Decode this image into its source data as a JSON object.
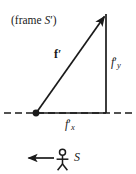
{
  "figure": {
    "background_color": "#ffffff",
    "stroke_color": "#1a1a1a",
    "width": 136,
    "height": 174
  },
  "labels": {
    "frame_prefix": "(frame ",
    "frame_symbol": "S",
    "frame_prime": "′)",
    "vector": "f",
    "vector_prime": "′",
    "component_y_base": "f",
    "component_y_prime": "′",
    "component_y_sub": "y",
    "component_x_base": "f",
    "component_x_prime": "′",
    "component_x_sub": "x",
    "observer": "S"
  },
  "geometry": {
    "origin": {
      "x": 36,
      "y": 113
    },
    "vector_tip": {
      "x": 106,
      "y": 14
    },
    "vertical_base": {
      "x": 106,
      "y": 113
    },
    "axis_y": 113,
    "axis_left_x": 4,
    "axis_right_x": 135,
    "dash_pattern": "7,4",
    "dot_radius": 3.4,
    "line_width": 1.6
  },
  "observer_figure": {
    "head_center": {
      "x": 62.5,
      "y": 152.5
    },
    "head_radius": 3.1,
    "body_top": {
      "x": 62.5,
      "y": 155.8
    },
    "body_bottom": {
      "x": 62.5,
      "y": 164
    },
    "arm_left": {
      "x": 56.5,
      "y": 159.5
    },
    "arm_right": {
      "x": 68.5,
      "y": 159.5
    },
    "leg_left": {
      "x": 57.5,
      "y": 170
    },
    "leg_right": {
      "x": 67.5,
      "y": 170
    }
  },
  "motion_arrow": {
    "from": {
      "x": 54,
      "y": 158
    },
    "to": {
      "x": 26,
      "y": 158
    },
    "direction": "left",
    "description": "observer motion arrow pointing left"
  }
}
